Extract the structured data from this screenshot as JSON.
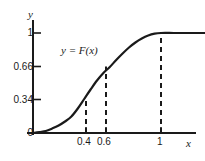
{
  "chart_data": {
    "type": "line",
    "title": "",
    "subtitle": "",
    "xlabel": "x",
    "ylabel": "y",
    "curve_label": "y = F(x)",
    "grid": false,
    "legend": null,
    "xlim": [
      0,
      1.35
    ],
    "ylim": [
      0,
      1.12
    ],
    "x_ticks": [
      {
        "value": 0,
        "label": "0"
      },
      {
        "value": 0.4,
        "label": "0.4"
      },
      {
        "value": 0.6,
        "label": "0.6"
      },
      {
        "value": 1,
        "label": "1"
      }
    ],
    "y_ticks": [
      {
        "value": 0,
        "label": "0"
      },
      {
        "value": 0.34,
        "label": "0.34"
      },
      {
        "value": 0.66,
        "label": "0.66"
      },
      {
        "value": 1,
        "label": "1"
      }
    ],
    "series": [
      {
        "name": "F(x)",
        "color": "#1a1a1a",
        "x": [
          0.0,
          0.05,
          0.1,
          0.15,
          0.2,
          0.25,
          0.3,
          0.35,
          0.4,
          0.45,
          0.5,
          0.55,
          0.6,
          0.65,
          0.7,
          0.75,
          0.8,
          0.85,
          0.9,
          0.95,
          1.0,
          1.1,
          1.2,
          1.35
        ],
        "y": [
          0.0,
          0.01,
          0.02,
          0.045,
          0.075,
          0.115,
          0.165,
          0.245,
          0.34,
          0.435,
          0.525,
          0.6,
          0.66,
          0.73,
          0.795,
          0.855,
          0.905,
          0.945,
          0.975,
          0.993,
          1.0,
          1.0,
          1.0,
          1.0
        ]
      }
    ],
    "annotations": [
      {
        "type": "dashed-vline",
        "x": 0.4,
        "y_from": 0,
        "y_to": 0.34
      },
      {
        "type": "dashed-vline",
        "x": 0.6,
        "y_from": 0,
        "y_to": 0.66
      },
      {
        "type": "dashed-vline",
        "x": 1.0,
        "y_from": 0,
        "y_to": 1.0
      }
    ]
  },
  "labels": {
    "y_axis_name": "y",
    "x_axis_name": "x",
    "curve_label": "y = F(x)",
    "y_tick_0": "0",
    "y_tick_034": "0.34",
    "y_tick_066": "0.66",
    "y_tick_1": "1",
    "x_tick_04": "0.4",
    "x_tick_06": "0.6",
    "x_tick_1": "1"
  },
  "colors": {
    "ink": "#1a1a1a",
    "background": "#ffffff"
  }
}
